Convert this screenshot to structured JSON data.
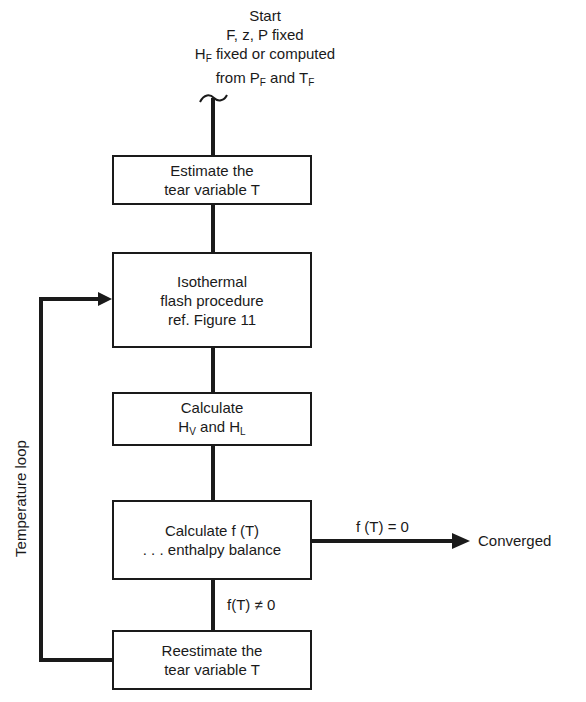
{
  "start": {
    "title": "Start",
    "line1": "F, z, P fixed",
    "line2_pre": "H",
    "line2_sub": "F",
    "line2_post": " fixed or computed",
    "line3_pre": "from P",
    "line3_sub1": "F",
    "line3_mid": " and T",
    "line3_sub2": "F"
  },
  "boxes": {
    "estimate": {
      "line1": "Estimate the",
      "line2": "tear variable T"
    },
    "flash": {
      "line1": "Isothermal",
      "line2": "flash procedure",
      "line3": "ref. Figure 11"
    },
    "enthalpy": {
      "line1": "Calculate",
      "line2_pre": "H",
      "line2_sub1": "V",
      "line2_mid": " and H",
      "line2_sub2": "L"
    },
    "fT": {
      "line1": "Calculate f (T)",
      "line2": ". . . enthalpy balance"
    },
    "reestimate": {
      "line1": "Reestimate the",
      "line2": "tear variable T"
    }
  },
  "labels": {
    "converged_condition": "f (T) = 0",
    "converged": "Converged",
    "not_converged_condition": "f(T) ≠ 0",
    "loop": "Temperature loop"
  },
  "colors": {
    "ink": "#1a1a1a",
    "background": "#ffffff"
  }
}
